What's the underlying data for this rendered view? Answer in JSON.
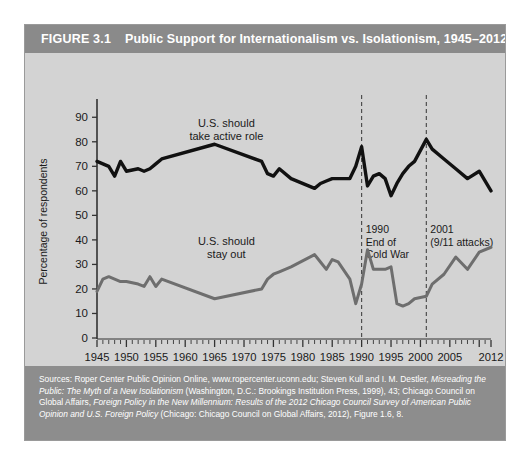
{
  "figure": {
    "number": "FIGURE 3.1",
    "title": "Public Support for Internationalism vs. Isolationism, 1945–2012"
  },
  "source": {
    "line1_plain_a": "Sources: Roper Center Public Opinion Online, www.ropercenter.uconn.edu; Steven Kull and I. M. Destler, ",
    "line1_italic": "Misreading the Public: The Myth of a New Isolationism",
    "line1_plain_b": " (Washington, D.C.: Brookings Institution Press, 1999), 43; Chicago Council on Global Affairs, ",
    "line2_italic": "Foreign Policy in the New Millennium: Results of the 2012 Chicago Council Survey of American Public Opinion and U.S. Foreign Policy",
    "line2_plain": " (Chicago: Chicago Council on Global Affairs, 2012), Figure 1.6, 8."
  },
  "colors": {
    "panel_background": "#d3d3d3",
    "header_band": "#8a8a8a",
    "source_band": "#8d8d8d",
    "active_role_line": "#111111",
    "stay_out_line": "#6e6e6e",
    "axis": "#333333",
    "event_line": "#444444",
    "frame_border": "#9a9a9a"
  },
  "chart_data": {
    "type": "line",
    "title": "Public Support for Internationalism vs. Isolationism, 1945–2012",
    "xlabel": "",
    "ylabel": "Percentage of respondents",
    "xlim": [
      1945,
      2012
    ],
    "ylim": [
      0,
      95
    ],
    "yticks": [
      0,
      10,
      20,
      30,
      40,
      50,
      60,
      70,
      80,
      90
    ],
    "xticks": [
      1945,
      1950,
      1955,
      1960,
      1965,
      1970,
      1975,
      1980,
      1985,
      1990,
      1995,
      2000,
      2005,
      2012
    ],
    "xtick_labels": [
      "1945",
      "1950",
      "1955",
      "1960",
      "1965",
      "1970",
      "1975",
      "1980",
      "1985",
      "1990",
      "1995",
      "2000",
      "2005",
      "2012"
    ],
    "minor_tick_step": 1,
    "grid": false,
    "legend": "inline-annotations",
    "series": [
      {
        "name": "U.S. should take active role",
        "color": "#111111",
        "label_x": 1967,
        "label_y": 86,
        "x": [
          1945,
          1946,
          1947,
          1948,
          1949,
          1950,
          1952,
          1953,
          1954,
          1955,
          1956,
          1965,
          1973,
          1974,
          1975,
          1976,
          1978,
          1982,
          1983,
          1984,
          1985,
          1986,
          1988,
          1989,
          1990,
          1991,
          1992,
          1993,
          1994,
          1995,
          1996,
          1997,
          1998,
          1999,
          2001,
          2002,
          2004,
          2006,
          2008,
          2010,
          2012
        ],
        "y": [
          72,
          71,
          70,
          66,
          72,
          68,
          69,
          68,
          69,
          71,
          73,
          79,
          72,
          67,
          66,
          69,
          65,
          61,
          63,
          64,
          65,
          65,
          65,
          70,
          78,
          62,
          66,
          67,
          65,
          58,
          63,
          67,
          70,
          72,
          81,
          77,
          73,
          69,
          65,
          68,
          60
        ]
      },
      {
        "name": "U.S. should stay out",
        "color": "#6e6e6e",
        "label_x": 1967,
        "label_y": 38,
        "x": [
          1945,
          1946,
          1947,
          1948,
          1949,
          1950,
          1952,
          1953,
          1954,
          1955,
          1956,
          1965,
          1973,
          1974,
          1975,
          1976,
          1978,
          1982,
          1983,
          1984,
          1985,
          1986,
          1988,
          1989,
          1990,
          1991,
          1992,
          1993,
          1994,
          1995,
          1996,
          1997,
          1998,
          1999,
          2001,
          2002,
          2004,
          2006,
          2008,
          2010,
          2012
        ],
        "y": [
          19,
          24,
          25,
          24,
          23,
          23,
          22,
          21,
          25,
          21,
          24,
          16,
          20,
          24,
          26,
          27,
          29,
          34,
          31,
          28,
          32,
          31,
          24,
          14,
          22,
          36,
          28,
          28,
          28,
          29,
          14,
          13,
          14,
          16,
          17,
          22,
          26,
          33,
          28,
          35,
          37
        ]
      }
    ],
    "annotations": [
      {
        "name": "end-of-cold-war",
        "year": 1990,
        "lines": [
          "1990",
          "End of",
          "Cold War"
        ]
      },
      {
        "name": "september-eleven",
        "year": 2001,
        "lines": [
          "2001",
          "(9/11 attacks)"
        ]
      }
    ]
  }
}
